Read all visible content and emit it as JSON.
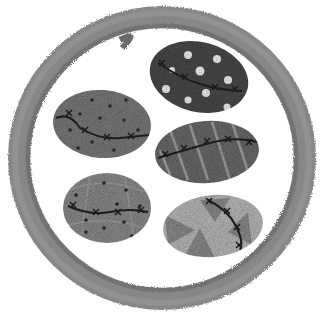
{
  "image": {
    "description": "Grayscale watercolor-style illustration of a round ring/bowl containing five patterned, stitched stones",
    "colors": {
      "background": "#ffffff",
      "ring": "#6e6e6e",
      "ring_light": "#9a9a9a",
      "stitch": "#2a2a2a"
    },
    "stones": [
      {
        "position": "top-right",
        "pattern": "white polka dots",
        "fill": "#4a4a4a"
      },
      {
        "position": "middle-left",
        "pattern": "small dark dots",
        "fill": "#7a7a7a"
      },
      {
        "position": "middle-right",
        "pattern": "light diagonal stripes",
        "fill": "#6a6a6a"
      },
      {
        "position": "bottom-left",
        "pattern": "dots and faint lines",
        "fill": "#8a8a8a"
      },
      {
        "position": "bottom-right",
        "pattern": "triangles",
        "fill": "#b5b5b5"
      }
    ]
  }
}
